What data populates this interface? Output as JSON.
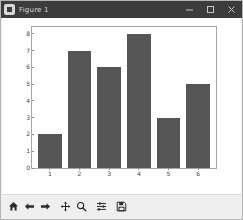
{
  "window": {
    "title": "Figure 1",
    "app_icon": "matplotlib-icon",
    "controls": [
      {
        "name": "minimize-button",
        "glyph": "minimize-icon"
      },
      {
        "name": "maximize-button",
        "glyph": "maximize-icon"
      },
      {
        "name": "close-button",
        "glyph": "close-icon"
      }
    ]
  },
  "toolbar": {
    "buttons": [
      {
        "name": "home-button",
        "icon": "home-icon",
        "tooltip": "Reset original view"
      },
      {
        "name": "back-button",
        "icon": "arrow-left-icon",
        "tooltip": "Back to previous view"
      },
      {
        "name": "forward-button",
        "icon": "arrow-right-icon",
        "tooltip": "Forward to next view"
      },
      {
        "name": "pan-button",
        "icon": "move-cross-icon",
        "tooltip": "Pan axes with left mouse, zoom with right"
      },
      {
        "name": "zoom-button",
        "icon": "magnifier-icon",
        "tooltip": "Zoom to rectangle"
      },
      {
        "name": "subplots-button",
        "icon": "sliders-icon",
        "tooltip": "Configure subplots"
      },
      {
        "name": "save-button",
        "icon": "floppy-disk-icon",
        "tooltip": "Save the figure"
      }
    ]
  },
  "colors": {
    "bar": "#555555",
    "titlebar": "#3c3c3c",
    "canvas": "#ffffff",
    "toolbar": "#efefef",
    "axis": "#a6a6a6",
    "tick_text": "#444444"
  },
  "chart_data": {
    "type": "bar",
    "title": "",
    "xlabel": "",
    "ylabel": "",
    "categories": [
      "1",
      "2",
      "3",
      "4",
      "5",
      "6"
    ],
    "values": [
      2,
      7,
      6,
      8,
      3,
      5
    ],
    "xlim": [
      0.4,
      6.6
    ],
    "ylim": [
      0,
      8.4
    ],
    "yticks": [
      0,
      1,
      2,
      3,
      4,
      5,
      6,
      7,
      8
    ],
    "ytick_labels": [
      "0",
      "1",
      "2",
      "3",
      "4",
      "5",
      "6",
      "7",
      "8"
    ],
    "xticks": [
      1,
      2,
      3,
      4,
      5,
      6
    ],
    "xtick_labels": [
      "1",
      "2",
      "3",
      "4",
      "5",
      "6"
    ],
    "grid": false,
    "legend": null,
    "bar_color": "#555555",
    "bar_width": 0.8
  }
}
